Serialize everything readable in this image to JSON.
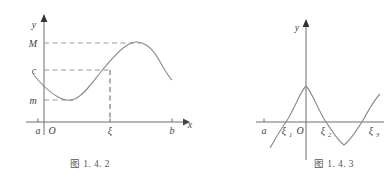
{
  "figures": [
    {
      "id": "figure-1-4-2",
      "caption": "图 1. 4. 2",
      "axis": {
        "y_label": "y",
        "x_label": "x",
        "origin_label": "O"
      },
      "y_ticks": [
        {
          "label": "M",
          "value": "M"
        },
        {
          "label": "c",
          "value": "c"
        },
        {
          "label": "m",
          "value": "m"
        }
      ],
      "x_ticks": [
        {
          "label": "a"
        },
        {
          "label": "ξ"
        },
        {
          "label": "b"
        }
      ],
      "guides": [
        {
          "name": "horizontal-dashed-M",
          "from": "y-axis",
          "to": "curve-maximum"
        },
        {
          "name": "horizontal-dashed-c",
          "from": "y-axis",
          "to": "xi"
        },
        {
          "name": "horizontal-dashed-m",
          "from": "y-axis",
          "to": "curve-minimum"
        },
        {
          "name": "vertical-dashed-xi",
          "from": "c",
          "to": "x-axis"
        }
      ],
      "curve": {
        "name": "continuous-function-curve",
        "description": "decreasing to minimum m, rising through c at xi, up to maximum M, then decreasing"
      }
    },
    {
      "id": "figure-1-4-3",
      "caption": "图 1. 4. 3",
      "axis": {
        "y_label": "y",
        "origin_label": "O"
      },
      "x_ticks": [
        {
          "label": "a",
          "sub": ""
        },
        {
          "label": "ξ",
          "sub": "1"
        },
        {
          "label": "ξ",
          "sub": "2"
        },
        {
          "label": "ξ",
          "sub": "3"
        }
      ],
      "curve": {
        "name": "oscillating-function-curve",
        "description": "sinusoidal curve crossing the x-axis at xi1, xi2 and xi3"
      }
    }
  ],
  "colors": {
    "curve": "#8a8a8a",
    "axis": "#6e6e6e",
    "dashed": "#9a9a9a",
    "text": "#3f3f3f",
    "background": "#ffffff"
  }
}
